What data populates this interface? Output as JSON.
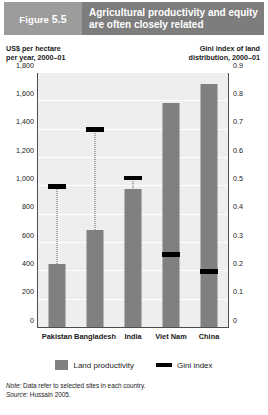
{
  "header": {
    "figure_prefix": "Figure",
    "figure_number": "5.5",
    "title": "Agricultural productivity and equity are often closely related"
  },
  "axis_captions": {
    "left": "US$ per hectare\nper year, 2000–01",
    "left_line1": "US$ per hectare",
    "left_line2": "per year, 2000–01",
    "right_line1": "Gini index of land",
    "right_line2": "distribution, 2000–01"
  },
  "legend": {
    "items": [
      {
        "label": "Land productivity",
        "icon": "bar-swatch",
        "color": "#808080"
      },
      {
        "label": "Gini index",
        "icon": "line-swatch",
        "color": "#000000"
      }
    ]
  },
  "footnotes": {
    "note_label": "Note:",
    "note_text": " Data refer to selected sites in each country.",
    "source_label": "Source:",
    "source_text": " Hussain 2005."
  },
  "chart_data": {
    "type": "bar",
    "title": "Agricultural productivity and equity are often closely related",
    "categories": [
      "Pakistan",
      "Bangladesh",
      "India",
      "Viet Nam",
      "China"
    ],
    "series": [
      {
        "name": "Land productivity",
        "axis": "left",
        "unit": "US$ per hectare per year, 2000–01",
        "color": "#808080",
        "values": [
          450,
          690,
          980,
          1590,
          1720
        ]
      },
      {
        "name": "Gini index",
        "axis": "right",
        "unit": "Gini index of land distribution, 2000–01",
        "color": "#000000",
        "values": [
          0.5,
          0.7,
          0.53,
          0.26,
          0.2
        ]
      }
    ],
    "xlabel": "",
    "ylabel": "US$ per hectare per year, 2000–01",
    "y2label": "Gini index of land distribution, 2000–01",
    "ylim": [
      0,
      1800
    ],
    "y2lim": [
      0,
      0.9
    ],
    "yticks": [
      "0",
      "200",
      "400",
      "600",
      "800",
      "1,000",
      "1,200",
      "1,400",
      "1,600",
      "1,800"
    ],
    "y2ticks": [
      "0",
      "0.1",
      "0.2",
      "0.3",
      "0.4",
      "0.5",
      "0.6",
      "0.7",
      "0.8",
      "0.9"
    ],
    "grid": true,
    "legend_position": "bottom",
    "note": "Data refer to selected sites in each country.",
    "source": "Hussain 2005."
  }
}
